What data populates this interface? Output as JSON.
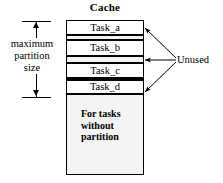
{
  "diagram": {
    "title": "Cache",
    "left_annotation": {
      "lines": [
        "maximum",
        "partition",
        "size"
      ],
      "arrow": "double-headed-vertical-arrow"
    },
    "right_annotation": {
      "label": "Unused",
      "arrow_count": 3
    },
    "cache_rows": [
      {
        "type": "task",
        "label": "Task_a"
      },
      {
        "type": "unused",
        "label": ""
      },
      {
        "type": "task",
        "label": "Task_b"
      },
      {
        "type": "unused",
        "label": ""
      },
      {
        "type": "task",
        "label": "Task_c"
      },
      {
        "type": "unused",
        "label": ""
      },
      {
        "type": "task",
        "label": "Task_d"
      }
    ],
    "free_pool": {
      "lines": [
        "For tasks",
        "without",
        "partition"
      ]
    },
    "colors": {
      "stroke": "#000000",
      "background": "#ffffff",
      "stipple_fill": "#f2f2f2",
      "stipple_dot": "#8d8d8d"
    }
  }
}
